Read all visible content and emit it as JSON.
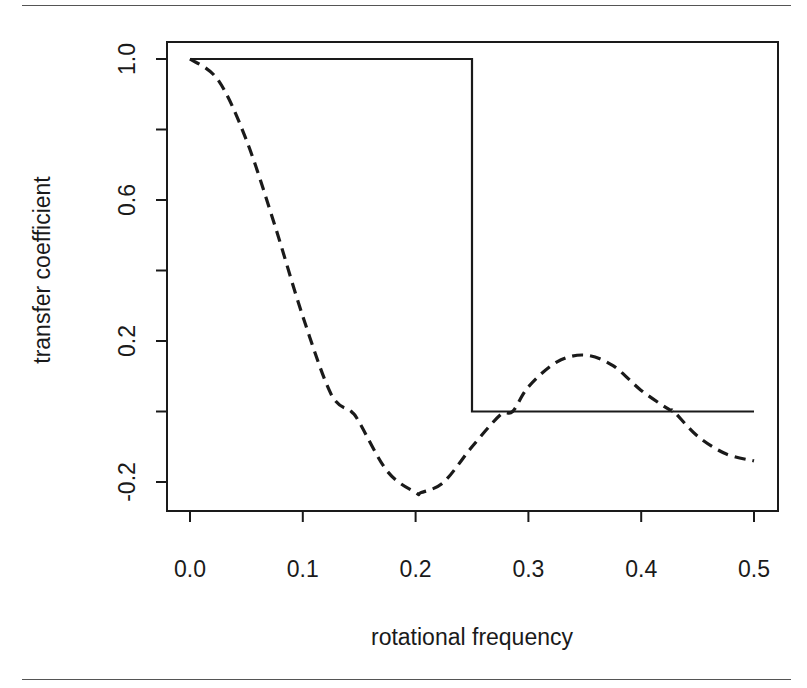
{
  "chart_data": {
    "type": "line",
    "title": "",
    "xlabel": "rotational frequency",
    "ylabel": "transfer coefficient",
    "xlim": [
      0.0,
      0.5
    ],
    "ylim": [
      -0.25,
      1.05
    ],
    "x_ticks": [
      0.0,
      0.1,
      0.2,
      0.3,
      0.4,
      0.5
    ],
    "x_tick_labels": [
      "0.0",
      "0.1",
      "0.2",
      "0.3",
      "0.4",
      "0.5"
    ],
    "y_ticks": [
      -0.2,
      0.0,
      0.2,
      0.4,
      0.6,
      0.8,
      1.0
    ],
    "y_tick_labels": [
      "-0.2",
      "",
      "0.2",
      "",
      "0.6",
      "",
      "1.0"
    ],
    "grid": false,
    "legend": null,
    "series": [
      {
        "name": "ideal low-pass (solid)",
        "style": "solid",
        "x": [
          0.0,
          0.25,
          0.25,
          0.5
        ],
        "y": [
          1.0,
          1.0,
          0.0,
          0.0
        ]
      },
      {
        "name": "moving average (dashed)",
        "style": "dashed",
        "x": [
          0.0,
          0.025,
          0.05,
          0.075,
          0.1,
          0.125,
          0.143,
          0.15,
          0.175,
          0.2,
          0.205,
          0.225,
          0.25,
          0.275,
          0.286,
          0.3,
          0.325,
          0.35,
          0.375,
          0.4,
          0.425,
          0.429,
          0.45,
          0.475,
          0.5
        ],
        "y": [
          1.0,
          0.94,
          0.77,
          0.53,
          0.27,
          0.05,
          0.0,
          -0.03,
          -0.17,
          -0.23,
          -0.23,
          -0.2,
          -0.1,
          -0.01,
          0.0,
          0.07,
          0.14,
          0.16,
          0.13,
          0.06,
          0.005,
          0.0,
          -0.07,
          -0.12,
          -0.14
        ]
      }
    ]
  },
  "plot": {
    "frame": {
      "left": 167,
      "top": 42,
      "right": 778,
      "bottom": 511
    },
    "x_map": {
      "v0": 0.0,
      "px0": 190,
      "v1": 0.5,
      "px1": 754
    },
    "y_map": {
      "v0": 1.0,
      "px0": 59,
      "v1": -0.2,
      "px1": 482
    },
    "line_color": "#1a1a1a"
  }
}
